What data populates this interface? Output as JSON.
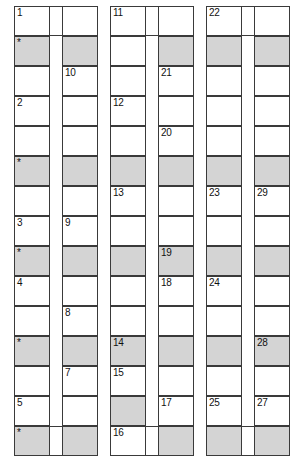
{
  "puzzle": {
    "title": "Numbered Crossword Skeleton Grid",
    "geometry": {
      "canvas_width": 302,
      "canvas_height": 469,
      "cell_width": 36,
      "cell_height": 30,
      "column_x": [
        14,
        62,
        110,
        158,
        206,
        254
      ],
      "row_y": [
        6,
        36,
        66,
        96,
        126,
        156,
        186,
        216,
        246,
        276,
        306,
        336,
        366,
        396,
        426
      ],
      "rows": 15,
      "columns": 6
    },
    "colors": {
      "page_background": "#ffffff",
      "cell_background": "#ffffff",
      "cell_shaded": "#d4d4d4",
      "border": "#3a3a3a",
      "text": "#111111"
    },
    "legend": {
      "star_marker": "*",
      "shaded_meaning": "shaded-cell"
    },
    "cells": [
      {
        "col": 0,
        "row": 0,
        "label": "1",
        "shaded": false
      },
      {
        "col": 0,
        "row": 1,
        "label": "*",
        "shaded": true
      },
      {
        "col": 0,
        "row": 2,
        "label": "",
        "shaded": false
      },
      {
        "col": 0,
        "row": 3,
        "label": "2",
        "shaded": false
      },
      {
        "col": 0,
        "row": 4,
        "label": "",
        "shaded": false
      },
      {
        "col": 0,
        "row": 5,
        "label": "*",
        "shaded": true
      },
      {
        "col": 0,
        "row": 6,
        "label": "",
        "shaded": false
      },
      {
        "col": 0,
        "row": 7,
        "label": "3",
        "shaded": false
      },
      {
        "col": 0,
        "row": 8,
        "label": "*",
        "shaded": true
      },
      {
        "col": 0,
        "row": 9,
        "label": "4",
        "shaded": false
      },
      {
        "col": 0,
        "row": 10,
        "label": "",
        "shaded": false
      },
      {
        "col": 0,
        "row": 11,
        "label": "*",
        "shaded": true
      },
      {
        "col": 0,
        "row": 12,
        "label": "",
        "shaded": false
      },
      {
        "col": 0,
        "row": 13,
        "label": "5",
        "shaded": false
      },
      {
        "col": 0,
        "row": 14,
        "label": "*",
        "shaded": true
      },
      {
        "col": 1,
        "row": 0,
        "label": "",
        "shaded": false
      },
      {
        "col": 1,
        "row": 1,
        "label": "",
        "shaded": true
      },
      {
        "col": 1,
        "row": 2,
        "label": "10",
        "shaded": false
      },
      {
        "col": 1,
        "row": 3,
        "label": "",
        "shaded": false
      },
      {
        "col": 1,
        "row": 4,
        "label": "",
        "shaded": false
      },
      {
        "col": 1,
        "row": 5,
        "label": "",
        "shaded": true
      },
      {
        "col": 1,
        "row": 6,
        "label": "",
        "shaded": false
      },
      {
        "col": 1,
        "row": 7,
        "label": "9",
        "shaded": false
      },
      {
        "col": 1,
        "row": 8,
        "label": "",
        "shaded": true
      },
      {
        "col": 1,
        "row": 9,
        "label": "",
        "shaded": false
      },
      {
        "col": 1,
        "row": 10,
        "label": "8",
        "shaded": false
      },
      {
        "col": 1,
        "row": 11,
        "label": "",
        "shaded": true
      },
      {
        "col": 1,
        "row": 12,
        "label": "7",
        "shaded": false
      },
      {
        "col": 1,
        "row": 13,
        "label": "",
        "shaded": false
      },
      {
        "col": 1,
        "row": 14,
        "label": "",
        "shaded": true
      },
      {
        "col": 2,
        "row": 0,
        "label": "11",
        "shaded": false
      },
      {
        "col": 2,
        "row": 1,
        "label": "",
        "shaded": false
      },
      {
        "col": 2,
        "row": 2,
        "label": "",
        "shaded": false
      },
      {
        "col": 2,
        "row": 3,
        "label": "12",
        "shaded": false
      },
      {
        "col": 2,
        "row": 4,
        "label": "",
        "shaded": false
      },
      {
        "col": 2,
        "row": 5,
        "label": "",
        "shaded": true
      },
      {
        "col": 2,
        "row": 6,
        "label": "13",
        "shaded": false
      },
      {
        "col": 2,
        "row": 7,
        "label": "",
        "shaded": false
      },
      {
        "col": 2,
        "row": 8,
        "label": "",
        "shaded": true
      },
      {
        "col": 2,
        "row": 9,
        "label": "",
        "shaded": false
      },
      {
        "col": 2,
        "row": 10,
        "label": "",
        "shaded": false
      },
      {
        "col": 2,
        "row": 11,
        "label": "14",
        "shaded": true
      },
      {
        "col": 2,
        "row": 12,
        "label": "15",
        "shaded": false
      },
      {
        "col": 2,
        "row": 13,
        "label": "",
        "shaded": true
      },
      {
        "col": 2,
        "row": 14,
        "label": "16",
        "shaded": false
      },
      {
        "col": 3,
        "row": 0,
        "label": "",
        "shaded": false
      },
      {
        "col": 3,
        "row": 1,
        "label": "",
        "shaded": true
      },
      {
        "col": 3,
        "row": 2,
        "label": "21",
        "shaded": false
      },
      {
        "col": 3,
        "row": 3,
        "label": "",
        "shaded": false
      },
      {
        "col": 3,
        "row": 4,
        "label": "20",
        "shaded": false
      },
      {
        "col": 3,
        "row": 5,
        "label": "",
        "shaded": true
      },
      {
        "col": 3,
        "row": 6,
        "label": "",
        "shaded": false
      },
      {
        "col": 3,
        "row": 7,
        "label": "",
        "shaded": false
      },
      {
        "col": 3,
        "row": 8,
        "label": "19",
        "shaded": true
      },
      {
        "col": 3,
        "row": 9,
        "label": "18",
        "shaded": false
      },
      {
        "col": 3,
        "row": 10,
        "label": "",
        "shaded": false
      },
      {
        "col": 3,
        "row": 11,
        "label": "",
        "shaded": true
      },
      {
        "col": 3,
        "row": 12,
        "label": "",
        "shaded": false
      },
      {
        "col": 3,
        "row": 13,
        "label": "17",
        "shaded": false
      },
      {
        "col": 3,
        "row": 14,
        "label": "",
        "shaded": true
      },
      {
        "col": 4,
        "row": 0,
        "label": "22",
        "shaded": false
      },
      {
        "col": 4,
        "row": 1,
        "label": "",
        "shaded": true
      },
      {
        "col": 4,
        "row": 2,
        "label": "",
        "shaded": false
      },
      {
        "col": 4,
        "row": 3,
        "label": "",
        "shaded": false
      },
      {
        "col": 4,
        "row": 4,
        "label": "",
        "shaded": false
      },
      {
        "col": 4,
        "row": 5,
        "label": "",
        "shaded": true
      },
      {
        "col": 4,
        "row": 6,
        "label": "23",
        "shaded": false
      },
      {
        "col": 4,
        "row": 7,
        "label": "",
        "shaded": false
      },
      {
        "col": 4,
        "row": 8,
        "label": "",
        "shaded": true
      },
      {
        "col": 4,
        "row": 9,
        "label": "24",
        "shaded": false
      },
      {
        "col": 4,
        "row": 10,
        "label": "",
        "shaded": false
      },
      {
        "col": 4,
        "row": 11,
        "label": "",
        "shaded": true
      },
      {
        "col": 4,
        "row": 12,
        "label": "",
        "shaded": false
      },
      {
        "col": 4,
        "row": 13,
        "label": "25",
        "shaded": false
      },
      {
        "col": 4,
        "row": 14,
        "label": "",
        "shaded": true
      },
      {
        "col": 5,
        "row": 0,
        "label": "",
        "shaded": false
      },
      {
        "col": 5,
        "row": 1,
        "label": "",
        "shaded": true
      },
      {
        "col": 5,
        "row": 2,
        "label": "",
        "shaded": false
      },
      {
        "col": 5,
        "row": 3,
        "label": "",
        "shaded": false
      },
      {
        "col": 5,
        "row": 4,
        "label": "",
        "shaded": false
      },
      {
        "col": 5,
        "row": 5,
        "label": "",
        "shaded": true
      },
      {
        "col": 5,
        "row": 6,
        "label": "29",
        "shaded": false
      },
      {
        "col": 5,
        "row": 7,
        "label": "",
        "shaded": false
      },
      {
        "col": 5,
        "row": 8,
        "label": "",
        "shaded": true
      },
      {
        "col": 5,
        "row": 9,
        "label": "",
        "shaded": false
      },
      {
        "col": 5,
        "row": 10,
        "label": "",
        "shaded": false
      },
      {
        "col": 5,
        "row": 11,
        "label": "28",
        "shaded": true
      },
      {
        "col": 5,
        "row": 12,
        "label": "",
        "shaded": false
      },
      {
        "col": 5,
        "row": 13,
        "label": "27",
        "shaded": false
      },
      {
        "col": 5,
        "row": 14,
        "label": "",
        "shaded": true
      }
    ],
    "bridges": [
      {
        "from_col": 0,
        "to_col": 1,
        "row": 0,
        "label": "",
        "shaded": false
      },
      {
        "from_col": 2,
        "to_col": 3,
        "row": 0,
        "label": "",
        "shaded": false
      },
      {
        "from_col": 4,
        "to_col": 5,
        "row": 0,
        "label": "",
        "shaded": false
      },
      {
        "from_col": 0,
        "to_col": 1,
        "row": 14,
        "label": "6",
        "shaded": false
      },
      {
        "from_col": 2,
        "to_col": 3,
        "row": 14,
        "label": "26",
        "shaded": false
      },
      {
        "from_col": 4,
        "to_col": 5,
        "row": 14,
        "label": "",
        "shaded": false
      }
    ],
    "bottom_labels": {
      "bridge_1": "6",
      "bridge_2": "16",
      "bridge_3": "26"
    }
  }
}
